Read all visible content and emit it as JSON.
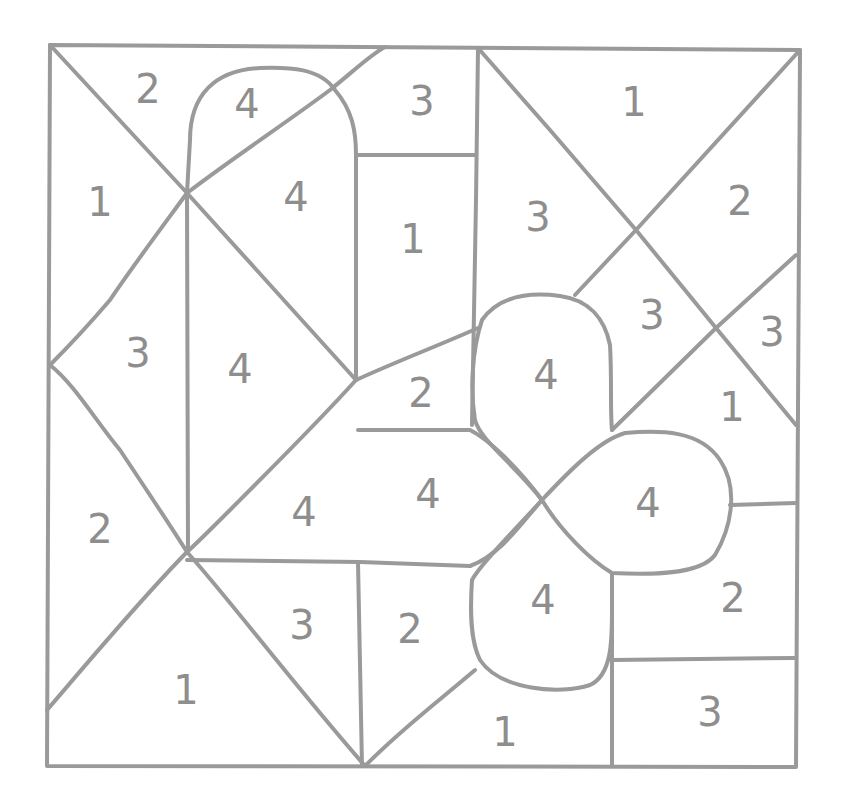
{
  "puzzle": {
    "type": "color-by-number",
    "line_color": "#9a9a9a",
    "number_color": "#8e8e8e",
    "regions": [
      {
        "label": "2",
        "x": 148,
        "y": 92
      },
      {
        "label": "4",
        "x": 247,
        "y": 107
      },
      {
        "label": "3",
        "x": 422,
        "y": 104
      },
      {
        "label": "1",
        "x": 634,
        "y": 105
      },
      {
        "label": "1",
        "x": 100,
        "y": 205
      },
      {
        "label": "4",
        "x": 296,
        "y": 200
      },
      {
        "label": "1",
        "x": 413,
        "y": 242
      },
      {
        "label": "3",
        "x": 538,
        "y": 220
      },
      {
        "label": "2",
        "x": 740,
        "y": 204
      },
      {
        "label": "3",
        "x": 138,
        "y": 356
      },
      {
        "label": "4",
        "x": 240,
        "y": 372
      },
      {
        "label": "2",
        "x": 421,
        "y": 396
      },
      {
        "label": "4",
        "x": 546,
        "y": 378
      },
      {
        "label": "3",
        "x": 652,
        "y": 318
      },
      {
        "label": "3",
        "x": 772,
        "y": 335
      },
      {
        "label": "1",
        "x": 732,
        "y": 410
      },
      {
        "label": "2",
        "x": 100,
        "y": 532
      },
      {
        "label": "4",
        "x": 304,
        "y": 515
      },
      {
        "label": "4",
        "x": 428,
        "y": 497
      },
      {
        "label": "4",
        "x": 648,
        "y": 506
      },
      {
        "label": "4",
        "x": 543,
        "y": 603
      },
      {
        "label": "3",
        "x": 302,
        "y": 628
      },
      {
        "label": "2",
        "x": 410,
        "y": 632
      },
      {
        "label": "2",
        "x": 733,
        "y": 601
      },
      {
        "label": "1",
        "x": 186,
        "y": 693
      },
      {
        "label": "1",
        "x": 505,
        "y": 735
      },
      {
        "label": "3",
        "x": 710,
        "y": 715
      }
    ]
  }
}
